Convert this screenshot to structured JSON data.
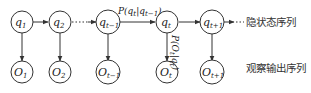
{
  "diagram": {
    "type": "hidden-markov-model",
    "hidden_nodes": [
      {
        "id": "q1",
        "base": "q",
        "sub": "1",
        "cx": 22
      },
      {
        "id": "q2",
        "base": "q",
        "sub": "2",
        "cx": 60
      },
      {
        "id": "qt-1",
        "base": "q",
        "sub": "t−1",
        "cx": 108
      },
      {
        "id": "qt",
        "base": "q",
        "sub": "t",
        "cx": 167
      },
      {
        "id": "qt+1",
        "base": "q",
        "sub": "t+1",
        "cx": 212
      }
    ],
    "observed_nodes": [
      {
        "id": "O1",
        "base": "O",
        "sub": "1",
        "cx": 22
      },
      {
        "id": "O2",
        "base": "O",
        "sub": "2",
        "cx": 60
      },
      {
        "id": "Ot-1",
        "base": "O",
        "sub": "t−1",
        "cx": 108
      },
      {
        "id": "Ot",
        "base": "O",
        "sub": "t",
        "cx": 167
      },
      {
        "id": "Ot+1",
        "base": "O",
        "sub": "t+1",
        "cx": 212
      }
    ],
    "transition_label": "P(q_t|q_{t−1})",
    "transition_label_parts": {
      "a": "P(q",
      "b": "t",
      "c": "|q",
      "d": "t−1",
      "e": ")"
    },
    "emission_label_parts": {
      "a": "P(O",
      "b": "t",
      "c": "|q",
      "d": "t",
      "e": ")"
    },
    "emission_label": "P(O_t|q_t)",
    "hidden_sequence_label": "隐状态序列",
    "observed_sequence_label": "观察输出序列",
    "colors": {
      "stroke": "#333333",
      "text": "#222222",
      "background": "#ffffff"
    }
  }
}
